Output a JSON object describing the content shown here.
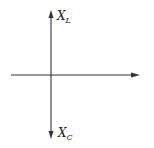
{
  "diagram": {
    "type": "axes",
    "labels": {
      "top": {
        "main": "X",
        "sub": "L"
      },
      "bottom": {
        "main": "X",
        "sub": "C"
      }
    },
    "colors": {
      "line": "#333333",
      "text": "#222222",
      "background": "#ffffff"
    }
  }
}
